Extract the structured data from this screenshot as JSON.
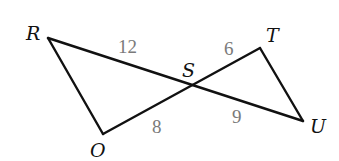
{
  "diagram": {
    "type": "geometry",
    "colors": {
      "line": "#111111",
      "vertex_label": "#111111",
      "length_label": "#7a7a7a"
    },
    "vertices": {
      "R": {
        "label": "R",
        "x": 48,
        "y": 38,
        "label_x": 26,
        "label_y": 40
      },
      "S": {
        "label": "S",
        "x": 193,
        "y": 86,
        "label_x": 182,
        "label_y": 77
      },
      "T": {
        "label": "T",
        "x": 260,
        "y": 48,
        "label_x": 266,
        "label_y": 42
      },
      "U": {
        "label": "U",
        "x": 303,
        "y": 121,
        "label_x": 310,
        "label_y": 133
      },
      "O": {
        "label": "O",
        "x": 103,
        "y": 134,
        "label_x": 90,
        "label_y": 157
      }
    },
    "segments": [
      {
        "from": "R",
        "to": "U",
        "via": "S"
      },
      {
        "from": "O",
        "to": "T",
        "via": "S"
      },
      {
        "from": "R",
        "to": "O"
      },
      {
        "from": "T",
        "to": "U"
      }
    ],
    "lengths": [
      {
        "segment": "RS",
        "value": "12",
        "x": 118,
        "y": 53
      },
      {
        "segment": "ST",
        "value": "6",
        "x": 224,
        "y": 55
      },
      {
        "segment": "OS",
        "value": "8",
        "x": 152,
        "y": 133
      },
      {
        "segment": "SU",
        "value": "9",
        "x": 232,
        "y": 123
      }
    ]
  }
}
